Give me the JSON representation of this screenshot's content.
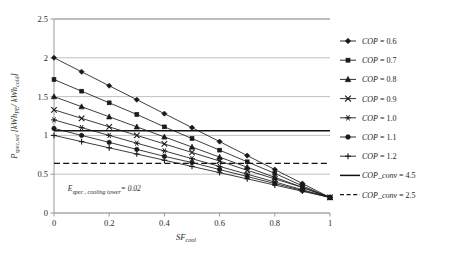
{
  "chart_data": {
    "type": "line",
    "title": "",
    "xlabel": "SF_cool",
    "ylabel": "P_spec,sol [kWh_PE / kWh_cold]",
    "xlim": [
      0,
      1
    ],
    "ylim": [
      0,
      2.5
    ],
    "xticks": [
      "0",
      "0.2",
      "0.4",
      "0.6",
      "0.8",
      "1"
    ],
    "yticks": [
      "0",
      "0.5",
      "1",
      "1.5",
      "2",
      "2.5"
    ],
    "xtick_values": [
      0,
      0.2,
      0.4,
      0.6,
      0.8,
      1.0
    ],
    "ytick_values": [
      0,
      0.5,
      1.0,
      1.5,
      2.0,
      2.5
    ],
    "grid": "horizontal",
    "legend_position": "right",
    "x": [
      0,
      0.1,
      0.2,
      0.3,
      0.4,
      0.5,
      0.6,
      0.7,
      0.8,
      0.9,
      1.0
    ],
    "series": [
      {
        "name": "COP = 0.6",
        "marker": "diamond",
        "values": [
          2.0,
          1.82,
          1.64,
          1.46,
          1.28,
          1.1,
          0.92,
          0.74,
          0.56,
          0.38,
          0.2
        ]
      },
      {
        "name": "COP = 0.7",
        "marker": "square",
        "values": [
          1.72,
          1.57,
          1.42,
          1.27,
          1.11,
          0.96,
          0.81,
          0.66,
          0.51,
          0.35,
          0.2
        ]
      },
      {
        "name": "COP = 0.8",
        "marker": "triangle",
        "values": [
          1.5,
          1.37,
          1.24,
          1.11,
          0.98,
          0.85,
          0.72,
          0.59,
          0.46,
          0.33,
          0.2
        ]
      },
      {
        "name": "COP = 0.9",
        "marker": "cross",
        "values": [
          1.33,
          1.22,
          1.11,
          1.0,
          0.89,
          0.78,
          0.67,
          0.55,
          0.44,
          0.33,
          0.2
        ]
      },
      {
        "name": "COP = 1.0",
        "marker": "star",
        "values": [
          1.2,
          1.1,
          1.0,
          0.9,
          0.8,
          0.7,
          0.6,
          0.5,
          0.4,
          0.3,
          0.2
        ]
      },
      {
        "name": "COP = 1.1",
        "marker": "circle",
        "values": [
          1.09,
          1.0,
          0.91,
          0.82,
          0.73,
          0.65,
          0.56,
          0.47,
          0.38,
          0.29,
          0.2
        ]
      },
      {
        "name": "COP = 1.2",
        "marker": "plus",
        "values": [
          1.0,
          0.92,
          0.84,
          0.76,
          0.68,
          0.6,
          0.52,
          0.44,
          0.36,
          0.28,
          0.2
        ]
      }
    ],
    "reference_lines": [
      {
        "name": "COP_conv = 4.5",
        "value": 1.06,
        "style": "solid"
      },
      {
        "name": "COP_conv = 2.5",
        "value": 0.64,
        "style": "dashed"
      }
    ],
    "annotations": [
      {
        "name": "cooling-tower-note",
        "text": "E_spec , cooling tower = 0.02",
        "x": 0.05,
        "y": 0.28
      }
    ]
  },
  "axis": {
    "ylabel_main": "P",
    "ylabel_sub": "spec,sol",
    "ylabel_unit": " [kWh",
    "ylabel_unit_sub1": "PE",
    "ylabel_unit_mid": "/ kWh",
    "ylabel_unit_sub2": "cold",
    "ylabel_unit_end": "]",
    "xlabel_main": "SF",
    "xlabel_sub": "cool"
  },
  "annotation": {
    "e_main": "E",
    "e_sub": "spec , cooling tower",
    "e_val": "= 0.02"
  },
  "legend": {
    "items": [
      {
        "label": "COP",
        "suffix": " = 0.6",
        "marker": "diamond"
      },
      {
        "label": "COP",
        "suffix": " = 0.7",
        "marker": "square"
      },
      {
        "label": "COP",
        "suffix": " = 0.8",
        "marker": "triangle"
      },
      {
        "label": "COP",
        "suffix": " = 0.9",
        "marker": "cross"
      },
      {
        "label": "COP",
        "suffix": " = 1.0",
        "marker": "star"
      },
      {
        "label": "COP",
        "suffix": " = 1.1",
        "marker": "circle"
      },
      {
        "label": "COP",
        "suffix": " = 1.2",
        "marker": "plus"
      },
      {
        "label": "COP_conv",
        "suffix": " = 4.5",
        "marker": "solidline"
      },
      {
        "label": "COP_conv",
        "suffix": " = 2.5",
        "marker": "dashedline"
      }
    ]
  },
  "colors": {
    "series": "#1a1a1a",
    "grid": "#b9b9b9",
    "frame": "#9a9a9a",
    "text": "#2b2b2b",
    "background": "#ffffff"
  }
}
